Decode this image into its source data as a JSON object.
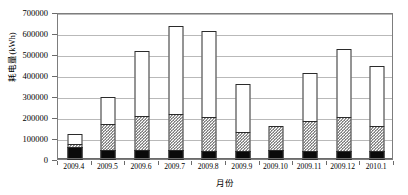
{
  "chart_data": {
    "type": "bar",
    "stacked": true,
    "title": "",
    "xlabel": "月份",
    "ylabel": "耗电量(kWh)",
    "categories": [
      "2009.4",
      "2009.5",
      "2009.6",
      "2009.7",
      "2009.8",
      "2009.9",
      "2009.10",
      "2009.11",
      "2009.12",
      "2010.1"
    ],
    "series": [
      {
        "name": "series-1-black",
        "fill": "solid-black",
        "color": "#0a0a0a",
        "values": [
          60000,
          48000,
          48000,
          48000,
          45000,
          45000,
          48000,
          45000,
          45000,
          45000
        ]
      },
      {
        "name": "series-2-hatched",
        "fill": "checkered-gray",
        "color": "#4a4a4a",
        "values": [
          22000,
          130000,
          165000,
          178000,
          165000,
          95000,
          117000,
          145000,
          165000,
          120000
        ]
      },
      {
        "name": "series-3-white",
        "fill": "solid-white",
        "color": "#ffffff",
        "values": [
          53000,
          132000,
          317000,
          424000,
          415000,
          230000,
          0,
          235000,
          330000,
          290000
        ]
      }
    ],
    "totals": [
      135000,
      310000,
      530000,
      650000,
      625000,
      370000,
      165000,
      425000,
      540000,
      455000
    ],
    "ylim": [
      0,
      700000
    ],
    "ytick_values": [
      0,
      100000,
      200000,
      300000,
      400000,
      500000,
      600000,
      700000
    ],
    "ytick_labels": [
      "0",
      "100000",
      "200000",
      "300000",
      "400000",
      "500000",
      "600000",
      "700000"
    ],
    "grid": true,
    "grid_axis": "y",
    "legend": null,
    "legend_position": "none"
  }
}
